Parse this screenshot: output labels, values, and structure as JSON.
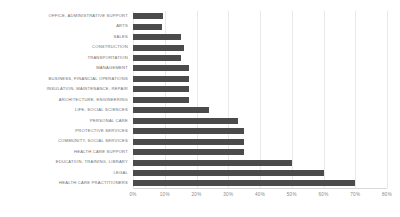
{
  "chart": {
    "title": "",
    "subtitle": "",
    "xlabel": "",
    "ylabel": "",
    "bar_color": "#4b4b4b",
    "grid_color": "#e9e9e9",
    "label_color": "#707070",
    "tick_color": "#8a8a8a",
    "background": "#ffffff"
  },
  "chart_data": {
    "type": "bar",
    "orientation": "horizontal",
    "title": "",
    "xlabel": "",
    "ylabel": "",
    "xlim": [
      0,
      80
    ],
    "x_tick_labels": [
      "0%",
      "10%",
      "20%",
      "30%",
      "40%",
      "50%",
      "60%",
      "70%",
      "80%"
    ],
    "x_ticks": [
      0,
      10,
      20,
      30,
      40,
      50,
      60,
      70,
      80
    ],
    "x_unit": "%",
    "grid": true,
    "grid_axis": "x",
    "legend": false,
    "legend_position": "none",
    "categories": [
      "OFFICE, ADMINISTRATIVE SUPPORT",
      "ARTS",
      "SALES",
      "CONSTRUCTION",
      "TRANSPORTATION",
      "MANAGEMENT",
      "BUSINESS, FINANCIAL OPERATIONS",
      "INSULATION, MAINTENANCE, REPAIR",
      "ARCHITECTURE, ENGINEERING",
      "LIFE, SOCIAL SCIENCES",
      "PERSONAL CARE",
      "PROTECTIVE SERVICES",
      "COMMUNITY, SOCIAL SERVICES",
      "HEALTH CARE SUPPORT",
      "EDUCATION, TRAINING, LIBRARY",
      "LEGAL",
      "HEALTH CARE PRACTITIONERS"
    ],
    "values": [
      9.5,
      9,
      15,
      16,
      15,
      17.5,
      17.5,
      17.5,
      17.5,
      24,
      33,
      35,
      35,
      35,
      50,
      60,
      70
    ],
    "series": [
      {
        "name": "",
        "values": [
          9.5,
          9,
          15,
          16,
          15,
          17.5,
          17.5,
          17.5,
          17.5,
          24,
          33,
          35,
          35,
          35,
          50,
          60,
          70
        ]
      }
    ]
  }
}
